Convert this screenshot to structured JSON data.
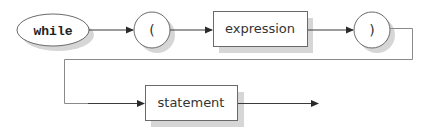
{
  "diagram": {
    "type": "railroad-syntax-diagram",
    "nodes": [
      {
        "id": "while",
        "kind": "terminal-keyword",
        "shape": "ellipse",
        "label": "while"
      },
      {
        "id": "lparen",
        "kind": "terminal-symbol",
        "shape": "circle",
        "label": "("
      },
      {
        "id": "expression",
        "kind": "non-terminal",
        "shape": "rectangle",
        "label": "expression"
      },
      {
        "id": "rparen",
        "kind": "terminal-symbol",
        "shape": "circle",
        "label": ")"
      },
      {
        "id": "statement",
        "kind": "non-terminal",
        "shape": "rectangle",
        "label": "statement"
      }
    ],
    "edges": [
      {
        "from": "while",
        "to": "lparen"
      },
      {
        "from": "lparen",
        "to": "expression"
      },
      {
        "from": "expression",
        "to": "rparen"
      },
      {
        "from": "rparen",
        "to": "statement",
        "routing": "wrap-around to second row"
      },
      {
        "from": "statement",
        "to": "end"
      }
    ],
    "colors": {
      "outline": "#6a6a6a",
      "shadow": "#d6d6d6",
      "edge": "#3a3a3a",
      "background": "#ffffff"
    }
  }
}
